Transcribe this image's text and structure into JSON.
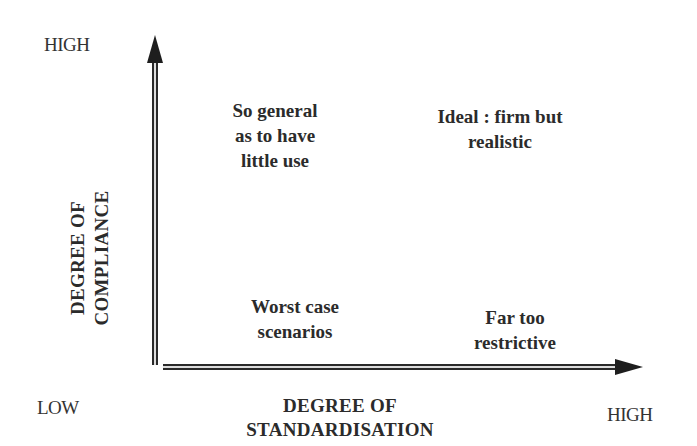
{
  "diagram": {
    "type": "2x2 matrix",
    "y_axis": {
      "title_line1": "DEGREE OF",
      "title_line2": "COMPLIANCE",
      "high_label": "HIGH",
      "low_label": "LOW"
    },
    "x_axis": {
      "title_line1": "DEGREE OF",
      "title_line2": "STANDARDISATION",
      "high_label": "HIGH"
    },
    "quadrants": {
      "top_left": [
        "So general",
        "as to have",
        "little use"
      ],
      "top_right": [
        "Ideal : firm but",
        "realistic"
      ],
      "bottom_left": [
        "Worst case",
        "scenarios"
      ],
      "bottom_right": [
        "Far too",
        "restrictive"
      ]
    },
    "colors": {
      "axis": "#2a2a2a",
      "text": "#2b2b2b",
      "background": "#ffffff"
    }
  }
}
